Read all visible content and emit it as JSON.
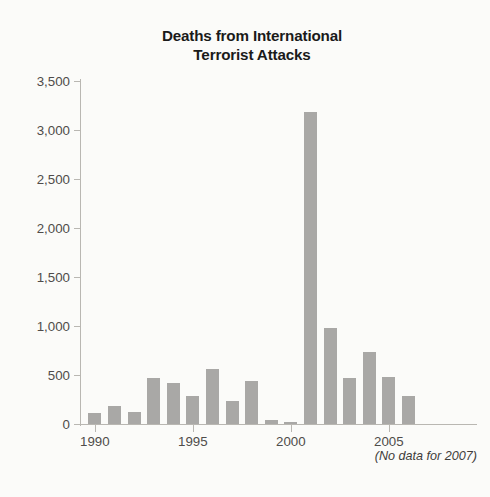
{
  "chart_data": {
    "type": "bar",
    "title": "Deaths from International Terrorist Attacks",
    "title_lines": [
      "Deaths from International",
      "Terrorist Attacks"
    ],
    "xlabel": "",
    "ylabel": "",
    "ylim": [
      0,
      3500
    ],
    "ytick_step": 500,
    "ytick_labels": [
      "3,500",
      "3,000",
      "2,500",
      "2,000",
      "1,500",
      "1,000",
      "500",
      "0"
    ],
    "ytick_values": [
      3500,
      3000,
      2500,
      2000,
      1500,
      1000,
      500,
      0
    ],
    "xtick_labels": [
      "1990",
      "1995",
      "2000",
      "2005"
    ],
    "xtick_values": [
      1990,
      1995,
      2000,
      2005
    ],
    "grid": false,
    "legend": "none",
    "bar_color": "#a9a8a6",
    "axis_color": "#b9b7b2",
    "text_color": "#4f4c4a",
    "title_color": "#1a1a1a",
    "background": "#fbfbf9",
    "annotation": "(No data for 2007)",
    "categories": [
      1990,
      1991,
      1992,
      1993,
      1994,
      1995,
      1996,
      1997,
      1998,
      1999,
      2000,
      2001,
      2002,
      2003,
      2004,
      2005,
      2006
    ],
    "values": [
      110,
      180,
      120,
      470,
      420,
      290,
      560,
      230,
      440,
      45,
      20,
      3180,
      980,
      470,
      730,
      480,
      290
    ]
  }
}
